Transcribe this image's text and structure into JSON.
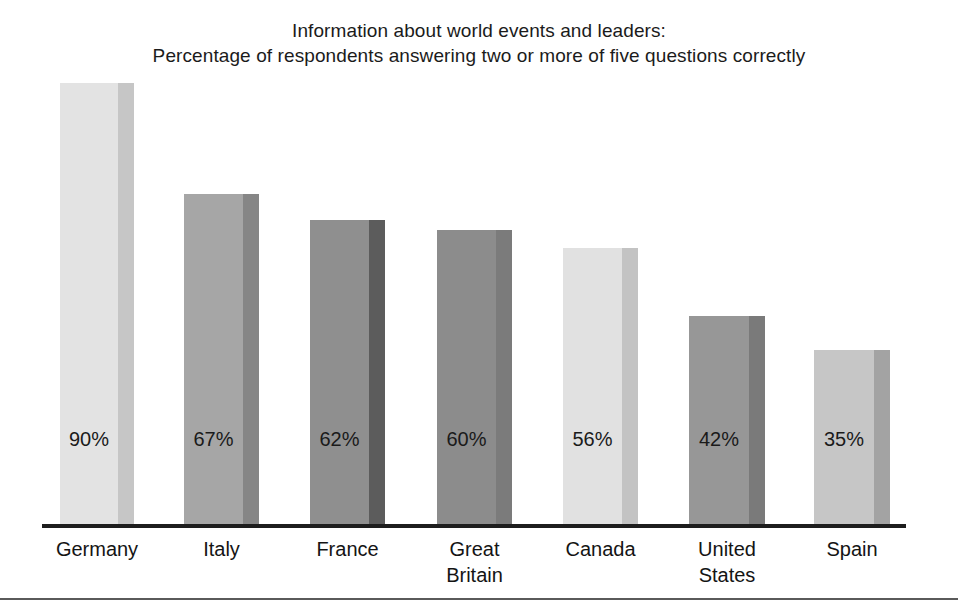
{
  "chart_data": {
    "type": "bar",
    "title": "Information about world events and leaders:\nPercentage of respondents answering two or more of five questions correctly",
    "title_lines": [
      "Information about world events and leaders:",
      "Percentage of respondents answering two or more of five questions correctly"
    ],
    "xlabel": "",
    "ylabel": "",
    "ylim": [
      0,
      100
    ],
    "grid": false,
    "legend": "none",
    "value_label_suffix": "%",
    "categories": [
      "Germany",
      "Italy",
      "France",
      "Great\nBritain",
      "Canada",
      "United\nStates",
      "Spain"
    ],
    "values": [
      90,
      67,
      62,
      60,
      56,
      42,
      35
    ],
    "value_labels": [
      "90%",
      "67%",
      "62%",
      "60%",
      "56%",
      "42%",
      "35%"
    ],
    "bars": [
      {
        "category": "Germany",
        "label_lines": [
          "Germany"
        ],
        "value": 90,
        "value_label": "90%",
        "face_color": "#e3e3e3",
        "side_color": "#c6c6c6",
        "x": 60,
        "width": 74,
        "side_width": 16,
        "top": 83
      },
      {
        "category": "Italy",
        "label_lines": [
          "Italy"
        ],
        "value": 67,
        "value_label": "67%",
        "face_color": "#a6a6a6",
        "side_color": "#868686",
        "x": 184,
        "width": 75,
        "side_width": 16,
        "top": 194
      },
      {
        "category": "France",
        "label_lines": [
          "France"
        ],
        "value": 62,
        "value_label": "62%",
        "face_color": "#8f8f8f",
        "side_color": "#5c5c5c",
        "x": 310,
        "width": 75,
        "side_width": 16,
        "top": 220
      },
      {
        "category": "Great Britain",
        "label_lines": [
          "Great",
          "Britain"
        ],
        "value": 60,
        "value_label": "60%",
        "face_color": "#8c8c8c",
        "side_color": "#7b7b7b",
        "x": 437,
        "width": 75,
        "side_width": 16,
        "top": 230
      },
      {
        "category": "Canada",
        "label_lines": [
          "Canada"
        ],
        "value": 56,
        "value_label": "56%",
        "face_color": "#e1e1e1",
        "side_color": "#c3c3c3",
        "x": 563,
        "width": 75,
        "side_width": 16,
        "top": 248
      },
      {
        "category": "United States",
        "label_lines": [
          "United",
          "States"
        ],
        "value": 42,
        "value_label": "42%",
        "face_color": "#979797",
        "side_color": "#7a7a7a",
        "x": 689,
        "width": 76,
        "side_width": 16,
        "top": 316
      },
      {
        "category": "Spain",
        "label_lines": [
          "Spain"
        ],
        "value": 35,
        "value_label": "35%",
        "face_color": "#c6c6c6",
        "side_color": "#a3a3a3",
        "x": 814,
        "width": 76,
        "side_width": 16,
        "top": 350
      }
    ],
    "axis": {
      "baseline_y": 524,
      "x_start": 42,
      "x_end": 906,
      "color": "#1d1d1d"
    },
    "bottom_rule": {
      "y": 598,
      "color": "#5a5a5a"
    },
    "value_label_y": 428
  }
}
